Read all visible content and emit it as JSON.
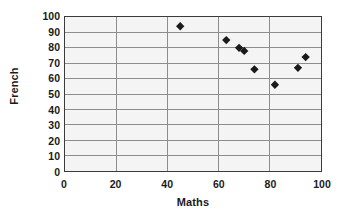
{
  "chart_data": {
    "type": "scatter",
    "title": "",
    "xlabel": "Maths",
    "ylabel": "French",
    "xlim": [
      0,
      100
    ],
    "ylim": [
      0,
      100
    ],
    "xticks": [
      0,
      20,
      40,
      60,
      80,
      100
    ],
    "yticks": [
      0,
      10,
      20,
      30,
      40,
      50,
      60,
      70,
      80,
      90,
      100
    ],
    "grid": "horizontal-and-vertical",
    "legend": "none",
    "marker": "diamond",
    "marker_color": "#1a1a1a",
    "plot_background": "#f4f4f4",
    "gridline_color": "#8c8c8c",
    "axis_color": "#3b3b3b",
    "series": [
      {
        "name": "Students",
        "points": [
          {
            "x": 45,
            "y": 94
          },
          {
            "x": 63,
            "y": 85
          },
          {
            "x": 68,
            "y": 80
          },
          {
            "x": 70,
            "y": 78
          },
          {
            "x": 74,
            "y": 66
          },
          {
            "x": 82,
            "y": 56
          },
          {
            "x": 91,
            "y": 67
          },
          {
            "x": 94,
            "y": 74
          }
        ]
      }
    ]
  }
}
